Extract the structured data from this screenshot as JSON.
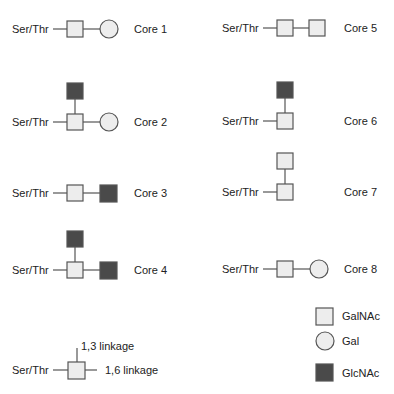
{
  "colors": {
    "galnac_fill": "#ededed",
    "gal_fill": "#ededed",
    "glcnac_fill": "#4a4a4a",
    "stroke": "#555555"
  },
  "amino_label": "Ser/Thr",
  "cores": [
    {
      "name": "Core 1",
      "structure": "GalNAc-(1,3)Gal"
    },
    {
      "name": "Core 2",
      "structure": "GalNAc-(1,3)Gal, (1,6)GlcNAc"
    },
    {
      "name": "Core 3",
      "structure": "GalNAc-GlcNAc"
    },
    {
      "name": "Core 4",
      "structure": "GalNAc-GlcNAc, GlcNAc"
    },
    {
      "name": "Core 5",
      "structure": "GalNAc-GalNAc"
    },
    {
      "name": "Core 6",
      "structure": "GalNAc-GlcNAc"
    },
    {
      "name": "Core 7",
      "structure": "GalNAc-GalNAc"
    },
    {
      "name": "Core 8",
      "structure": "GalNAc-Gal"
    }
  ],
  "linkage_key": {
    "label_13": "1,3 linkage",
    "label_16": "1,6 linkage"
  },
  "legend": [
    {
      "shape": "square",
      "label": "GalNAc"
    },
    {
      "shape": "circle",
      "label": "Gal"
    },
    {
      "shape": "filled-square",
      "label": "GlcNAc"
    }
  ]
}
